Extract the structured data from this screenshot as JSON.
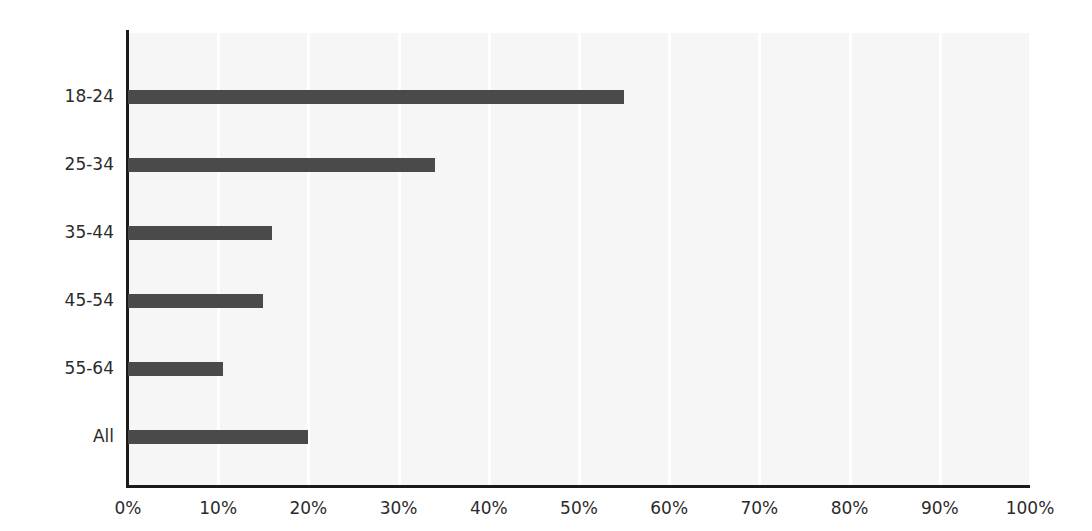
{
  "chart_data": {
    "type": "bar",
    "orientation": "horizontal",
    "title": "",
    "subtitle": "",
    "xlabel": "",
    "ylabel": "",
    "categories": [
      "18-24",
      "25-34",
      "35-44",
      "45-54",
      "55-64",
      "All"
    ],
    "values": [
      55,
      34,
      16,
      15,
      10.5,
      20
    ],
    "value_labels": [
      "55%",
      "34%",
      "16%",
      "15%",
      "10.5%",
      "20%"
    ],
    "xlim": [
      0,
      100
    ],
    "x_ticks": [
      0,
      10,
      20,
      30,
      40,
      50,
      60,
      70,
      80,
      90,
      100
    ],
    "x_tick_labels": [
      "0%",
      "10%",
      "20%",
      "30%",
      "40%",
      "50%",
      "60%",
      "70%",
      "80%",
      "90%",
      "100%"
    ],
    "series": [
      {
        "name": "",
        "values": [
          55,
          34,
          16,
          15,
          10.5,
          20
        ]
      }
    ],
    "grid": "vertical",
    "legend": "none",
    "annotations": []
  },
  "style": {
    "bar_color": "#4a4a4a",
    "plot_background": "#f6f6f6",
    "page_background": "#ffffff",
    "gridline_color": "#ffffff",
    "axis_color": "#1a1a1a",
    "tick_label_color": "#2b2b2b"
  }
}
